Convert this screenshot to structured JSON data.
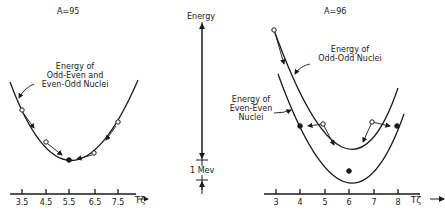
{
  "left_panel": {
    "title": "A=95",
    "curve_label": [
      "Energy of",
      "Odd-Even and",
      "Even-Odd Nuclei"
    ],
    "axis_ticks": [
      "3.5",
      "4.5",
      "5.5",
      "6.5",
      "7.5"
    ],
    "axis_label": "Tζ"
  },
  "center_scale": {
    "title": "Energy",
    "unit_label": "1 Mev"
  },
  "right_panel": {
    "title": "A=96",
    "odd_odd_label": [
      "Energy of",
      "Odd-Odd Nuclei"
    ],
    "even_even_label": [
      "Energy of",
      "Even-Even",
      "Nuclei"
    ],
    "axis_ticks": [
      "3",
      "4",
      "5",
      "6",
      "7",
      "8"
    ],
    "axis_label": "Tζ"
  },
  "colors": {
    "ink": "#1a1a1a",
    "background": "#ffffff"
  }
}
